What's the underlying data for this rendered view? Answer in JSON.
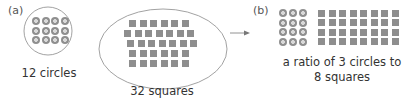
{
  "part_a": {
    "label": "(a)",
    "circles_group": {
      "caption": "12 circles",
      "count": 12,
      "rows": 3,
      "cols": 4
    },
    "squares_group": {
      "caption": "32 squares",
      "count": 32,
      "row_counts": [
        6,
        7,
        7,
        6,
        6
      ]
    }
  },
  "arrow": {
    "direction": "right"
  },
  "part_b": {
    "label": "(b)",
    "rows": 4,
    "circles_per_row": 3,
    "squares_per_row": 8,
    "caption_line1": "a ratio of 3 circles to",
    "caption_line2": "8 squares"
  },
  "colors": {
    "outline": "#8a8a8a",
    "shape_fill": "#8e8e8e",
    "text": "#333333"
  }
}
